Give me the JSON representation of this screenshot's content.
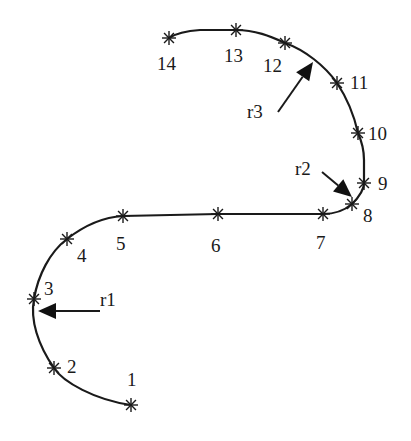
{
  "diagram": {
    "title": "",
    "stroke_color": "#1a1a1a",
    "background": "#ffffff",
    "points": [
      {
        "id": "1",
        "label": "1",
        "x": 131,
        "y": 405,
        "lx": 127,
        "ly": 386
      },
      {
        "id": "2",
        "label": "2",
        "x": 54,
        "y": 368,
        "lx": 67,
        "ly": 373
      },
      {
        "id": "3",
        "label": "3",
        "x": 34,
        "y": 299,
        "lx": 44,
        "ly": 295
      },
      {
        "id": "4",
        "label": "4",
        "x": 67,
        "y": 239,
        "lx": 77,
        "ly": 262
      },
      {
        "id": "5",
        "label": "5",
        "x": 123,
        "y": 216,
        "lx": 116,
        "ly": 250
      },
      {
        "id": "6",
        "label": "6",
        "x": 218,
        "y": 214,
        "lx": 211,
        "ly": 252
      },
      {
        "id": "7",
        "label": "7",
        "x": 323,
        "y": 214,
        "lx": 316,
        "ly": 249
      },
      {
        "id": "8",
        "label": "8",
        "x": 352,
        "y": 204,
        "lx": 363,
        "ly": 222
      },
      {
        "id": "9",
        "label": "9",
        "x": 364,
        "y": 183,
        "lx": 378,
        "ly": 190
      },
      {
        "id": "10",
        "label": "10",
        "x": 358,
        "y": 133,
        "lx": 368,
        "ly": 140
      },
      {
        "id": "11",
        "label": "11",
        "x": 337,
        "y": 83,
        "lx": 350,
        "ly": 89
      },
      {
        "id": "12",
        "label": "12",
        "x": 285,
        "y": 43,
        "lx": 263,
        "ly": 72
      },
      {
        "id": "13",
        "label": "13",
        "x": 236,
        "y": 30,
        "lx": 224,
        "ly": 62
      },
      {
        "id": "14",
        "label": "14",
        "x": 169,
        "y": 38,
        "lx": 157,
        "ly": 70
      }
    ],
    "annotations": [
      {
        "id": "r1",
        "label": "r1",
        "lx": 100,
        "ly": 306,
        "from": [
          100,
          311
        ],
        "to": [
          38,
          311
        ]
      },
      {
        "id": "r2",
        "label": "r2",
        "lx": 295,
        "ly": 175,
        "from": [
          322,
          172
        ],
        "to": [
          352,
          197
        ]
      },
      {
        "id": "r3",
        "label": "r3",
        "lx": 247,
        "ly": 118,
        "from": [
          278,
          112
        ],
        "to": [
          313,
          62
        ]
      }
    ]
  }
}
